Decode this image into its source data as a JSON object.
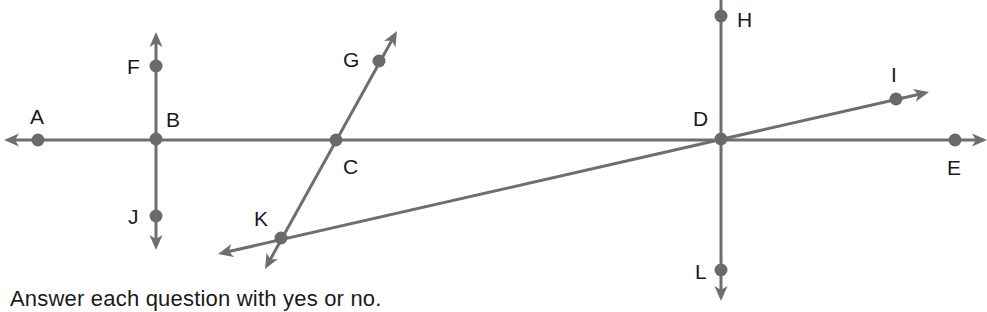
{
  "diagram": {
    "colors": {
      "line": "#6e6e6e",
      "point": "#6a6a6a",
      "label": "#1a1a1a"
    },
    "points": [
      {
        "name": "A",
        "x": 38,
        "y": 140,
        "label_x": 30,
        "label_y": 124
      },
      {
        "name": "B",
        "x": 156,
        "y": 139,
        "label_x": 166,
        "label_y": 127
      },
      {
        "name": "C",
        "x": 336,
        "y": 140,
        "label_x": 343,
        "label_y": 174
      },
      {
        "name": "D",
        "x": 721,
        "y": 139,
        "label_x": 693,
        "label_y": 126
      },
      {
        "name": "E",
        "x": 955,
        "y": 140,
        "label_x": 947,
        "label_y": 175
      },
      {
        "name": "F",
        "x": 156,
        "y": 66,
        "label_x": 127,
        "label_y": 74
      },
      {
        "name": "G",
        "x": 379,
        "y": 61,
        "label_x": 343,
        "label_y": 67
      },
      {
        "name": "H",
        "x": 721,
        "y": 16,
        "label_x": 737,
        "label_y": 27
      },
      {
        "name": "I",
        "x": 896,
        "y": 99,
        "label_x": 891,
        "label_y": 82
      },
      {
        "name": "J",
        "x": 156,
        "y": 216,
        "label_x": 128,
        "label_y": 224
      },
      {
        "name": "K",
        "x": 281,
        "y": 238,
        "label_x": 254,
        "label_y": 226
      },
      {
        "name": "L",
        "x": 721,
        "y": 270,
        "label_x": 695,
        "label_y": 279
      }
    ],
    "lines": [
      {
        "name": "line-AE",
        "through": [
          "A",
          "B",
          "C",
          "D",
          "E"
        ],
        "x1": 4,
        "y1": 140,
        "x2": 987,
        "y2": 140,
        "arrows": "both"
      },
      {
        "name": "line-FJ",
        "through": [
          "F",
          "B",
          "J"
        ],
        "x1": 156,
        "y1": 32,
        "x2": 156,
        "y2": 250,
        "arrows": "both"
      },
      {
        "name": "line-GK",
        "through": [
          "G",
          "C",
          "K"
        ],
        "x1": 397,
        "y1": 31,
        "x2": 265,
        "y2": 269,
        "arrows": "both"
      },
      {
        "name": "line-HL",
        "through": [
          "H",
          "D",
          "L"
        ],
        "x1": 721,
        "y1": 0,
        "x2": 721,
        "y2": 301,
        "arrows": "end"
      },
      {
        "name": "line-KI",
        "through": [
          "K",
          "D",
          "I"
        ],
        "x1": 218,
        "y1": 254,
        "x2": 929,
        "y2": 92,
        "arrows": "both"
      }
    ],
    "caption": "Answer each question with yes or no."
  }
}
